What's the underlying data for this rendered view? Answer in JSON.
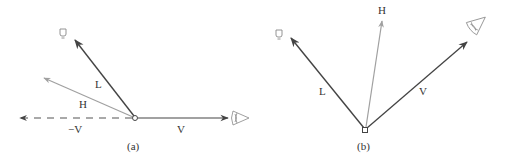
{
  "colors": {
    "dark_vector": "#444444",
    "light_vector": "#a0a0a0",
    "label": "#333333",
    "background": "#ffffff"
  },
  "panel_a": {
    "caption": "(a)",
    "labels": {
      "L": "L",
      "H": "H",
      "negV": "−V",
      "V": "V"
    },
    "icons": [
      "light-bulb-icon",
      "eye-icon"
    ]
  },
  "panel_b": {
    "caption": "(b)",
    "labels": {
      "L": "L",
      "H": "H",
      "V": "V"
    },
    "icons": [
      "light-bulb-icon",
      "eye-icon"
    ]
  }
}
